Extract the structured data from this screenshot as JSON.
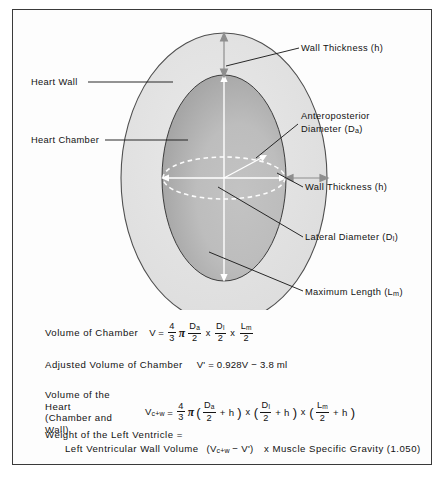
{
  "figure": {
    "title_visible": false,
    "frame_color": "#3a3a3a",
    "background": "#ffffff"
  },
  "diagram": {
    "name": "left-ventricle-ellipsoid-model",
    "colors": {
      "heart_wall_fill": "#e3e3e3",
      "heart_chamber_fill": "#b8b8b8",
      "stipple": "#4a4a4a",
      "outline": "#4a4a4a",
      "leader_line": "#1d1d1d",
      "white_arrow": "#ffffff"
    },
    "labels": [
      {
        "id": "wall-thickness-top",
        "text": "Wall Thickness (h)",
        "sub": ""
      },
      {
        "id": "heart-wall",
        "text": "Heart Wall",
        "sub": ""
      },
      {
        "id": "anteroposterior",
        "line1": "Anteroposterior",
        "line2": "Diameter (D",
        "sub": "a",
        "close": ")"
      },
      {
        "id": "heart-chamber",
        "text": "Heart Chamber",
        "sub": ""
      },
      {
        "id": "wall-thickness-right",
        "text": "Wall Thickness (h)",
        "sub": ""
      },
      {
        "id": "lateral-diameter",
        "text": "Lateral Diameter (D",
        "sub": "l",
        "close": ")"
      },
      {
        "id": "maximum-length",
        "text": "Maximum Length (L",
        "sub": "m",
        "close": ")"
      }
    ]
  },
  "formulas": {
    "volume_of_chamber": {
      "label": "Volume of Chamber",
      "lhs": "V",
      "equals": "=",
      "frac_coefficient": {
        "num": "4",
        "den": "3"
      },
      "pi": "π",
      "term1": {
        "num": "D",
        "num_sub": "a",
        "den": "2"
      },
      "times1": "x",
      "term2": {
        "num": "D",
        "num_sub": "l",
        "den": "2"
      },
      "times2": "x",
      "term3": {
        "num": "L",
        "num_sub": "m",
        "den": "2"
      }
    },
    "adjusted_volume_of_chamber": {
      "label": "Adjusted Volume of Chamber",
      "expression": "V' = 0.928V − 3.8 ml"
    },
    "volume_of_the_heart": {
      "label_line1": "Volume of the Heart",
      "label_line2": "(Chamber and Wall)",
      "lhs": "V",
      "lhs_sub": "c+w",
      "equals": "=",
      "frac_coefficient": {
        "num": "4",
        "den": "3"
      },
      "pi": "π",
      "term1": {
        "num": "D",
        "num_sub": "a",
        "den": "2",
        "plus": "+ h"
      },
      "times1": "x",
      "term2": {
        "num": "D",
        "num_sub": "l",
        "den": "2",
        "plus": "+ h"
      },
      "times2": "x",
      "term3": {
        "num": "L",
        "num_sub": "m",
        "den": "2",
        "plus": "+ h"
      }
    },
    "weight_of_the_left_ventricle": {
      "line1": "Weight of the Left Ventricle =",
      "line2_part1": "Left Ventricular Wall Volume",
      "line2_open": "(V",
      "line2_sub": "c+w",
      "line2_minus": "− V')",
      "line2_part2": "x Muscle Specific Gravity (1.050)"
    }
  }
}
